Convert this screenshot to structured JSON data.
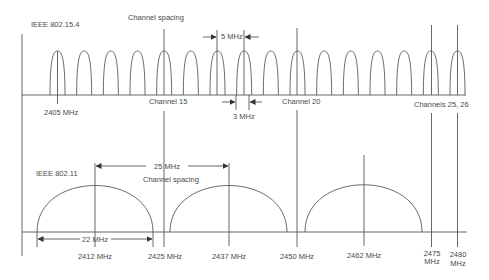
{
  "colors": {
    "line": "#555555",
    "text": "#4a4a4a",
    "background": "#ffffff"
  },
  "top": {
    "title": "IEEE 802.15.4",
    "spacing_label": "Channel spacing",
    "spacing_value": "5 MHz",
    "bandwidth_value": "3 MHz",
    "start_freq_label": "2405 MHz",
    "channel15_label": "Channel 15",
    "channel20_label": "Channel 20",
    "channels_25_26_label": "Channels 25, 26",
    "channels": [
      11,
      12,
      13,
      14,
      15,
      16,
      17,
      18,
      19,
      20,
      21,
      22,
      23,
      24,
      25,
      26
    ],
    "center_freqs_mhz": [
      2405,
      2410,
      2415,
      2420,
      2425,
      2430,
      2435,
      2440,
      2445,
      2450,
      2455,
      2460,
      2465,
      2470,
      2475,
      2480
    ]
  },
  "bottom": {
    "title": "IEEE 802.11",
    "spacing_value": "25 MHz",
    "spacing_label": "Channel spacing",
    "bandwidth_value": "22 MHz",
    "channel_centers_mhz": [
      2412,
      2437,
      2462
    ],
    "labels": {
      "f2412": "2412 MHz",
      "f2425": "2425 MHz",
      "f2437": "2437 MHz",
      "f2450": "2450 MHz",
      "f2462": "2462 MHz",
      "f2475_a": "2475",
      "f2475_b": "MHz",
      "f2480_a": "2480",
      "f2480_b": "MHz"
    }
  }
}
